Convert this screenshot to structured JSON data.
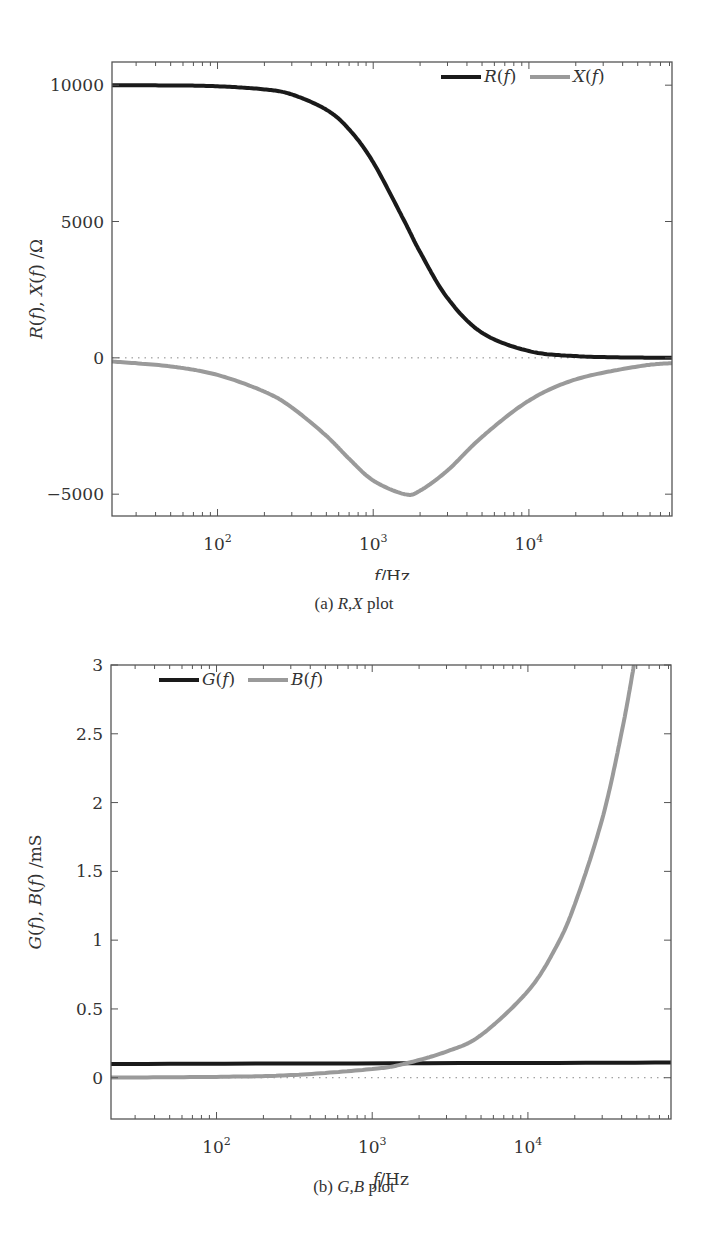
{
  "chart_data": [
    {
      "id": "a",
      "type": "line",
      "title": "",
      "caption": "(a) R,X plot",
      "caption_parts": {
        "label": "(a)",
        "math": "R,X",
        "suffix": "plot"
      },
      "xlabel": "f/Hz",
      "ylabel": "R(f), X(f) /Ω",
      "xscale": "log",
      "xlim": [
        21,
        83000
      ],
      "ylim": [
        -5800,
        10850
      ],
      "xticks": [
        {
          "value": 100,
          "label": "10",
          "exp": "2"
        },
        {
          "value": 1000,
          "label": "10",
          "exp": "3"
        },
        {
          "value": 10000,
          "label": "10",
          "exp": "4"
        }
      ],
      "yticks": [
        {
          "value": 10000,
          "label": "10000"
        },
        {
          "value": 5000,
          "label": "5000"
        },
        {
          "value": 0,
          "label": "0"
        },
        {
          "value": -5000,
          "label": "-5000"
        }
      ],
      "grid": false,
      "zero_line": "dotted",
      "legend": {
        "position": "top-right",
        "orientation": "horizontal",
        "entries": [
          "R(f)",
          "X(f)"
        ]
      },
      "series": [
        {
          "name": "R(f)",
          "color": "#1a1a1a",
          "x": [
            21,
            50,
            100,
            200,
            300,
            500,
            700,
            1000,
            1590,
            2000,
            3000,
            5000,
            10000,
            20000,
            50000,
            83000
          ],
          "y": [
            9998,
            9990,
            9960,
            9845,
            9660,
            9100,
            8380,
            7170,
            5000,
            3880,
            2190,
            920,
            250,
            63,
            10,
            4
          ]
        },
        {
          "name": "X(f)",
          "color": "#9a9a9a",
          "x": [
            21,
            50,
            100,
            200,
            300,
            500,
            700,
            1000,
            1590,
            2000,
            3000,
            5000,
            10000,
            20000,
            50000,
            83000
          ],
          "y": [
            -132,
            -314,
            -627,
            -1240,
            -1820,
            -2860,
            -3700,
            -4500,
            -5000,
            -4870,
            -4130,
            -2900,
            -1570,
            -790,
            -316,
            -192
          ]
        }
      ]
    },
    {
      "id": "b",
      "type": "line",
      "title": "",
      "caption": "(b) G,B plot",
      "caption_parts": {
        "label": "(b)",
        "math": "G,B",
        "suffix": "plot"
      },
      "xlabel": "f/Hz",
      "ylabel": "G(f), B(f) /mS",
      "xscale": "log",
      "xlim": [
        21,
        83000
      ],
      "ylim": [
        -0.3,
        3
      ],
      "xticks": [
        {
          "value": 100,
          "label": "10",
          "exp": "2"
        },
        {
          "value": 1000,
          "label": "10",
          "exp": "3"
        },
        {
          "value": 10000,
          "label": "10",
          "exp": "4"
        }
      ],
      "yticks": [
        {
          "value": 3,
          "label": "3"
        },
        {
          "value": 2.5,
          "label": "2.5"
        },
        {
          "value": 2,
          "label": "2"
        },
        {
          "value": 1.5,
          "label": "1.5"
        },
        {
          "value": 1,
          "label": "1"
        },
        {
          "value": 0.5,
          "label": "0.5"
        },
        {
          "value": 0,
          "label": "0"
        }
      ],
      "grid": false,
      "zero_line": "dotted",
      "legend": {
        "position": "top-left",
        "orientation": "horizontal",
        "entries": [
          "G(f)",
          "B(f)"
        ]
      },
      "series": [
        {
          "name": "G(f)",
          "color": "#1a1a1a",
          "x": [
            21,
            83000
          ],
          "y": [
            0.1,
            0.11
          ]
        },
        {
          "name": "B(f)",
          "color": "#9a9a9a",
          "x": [
            21,
            100,
            300,
            1000,
            1590,
            3000,
            5000,
            10000,
            15000,
            20000,
            30000,
            40000,
            48000
          ],
          "y": [
            0.0013,
            0.0063,
            0.019,
            0.063,
            0.1,
            0.19,
            0.31,
            0.63,
            0.94,
            1.26,
            1.88,
            2.51,
            3.0
          ]
        }
      ]
    }
  ]
}
